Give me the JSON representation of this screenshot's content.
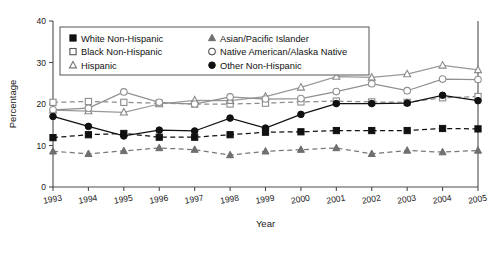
{
  "chart_data": {
    "type": "line",
    "title": "",
    "xlabel": "Year",
    "ylabel": "Percentage",
    "grid": false,
    "legend_position": "top-left-inside",
    "x": [
      1993,
      1994,
      1995,
      1996,
      1997,
      1998,
      1999,
      2000,
      2001,
      2002,
      2003,
      2004,
      2005
    ],
    "categories": [
      "1993",
      "1994",
      "1995",
      "1996",
      "1997",
      "1998",
      "1999",
      "2000",
      "2001",
      "2002",
      "2003",
      "2004",
      "2005"
    ],
    "xlim": [
      1993,
      2005
    ],
    "ylim": [
      0,
      40
    ],
    "yticks": [
      0,
      10,
      20,
      30,
      40
    ],
    "series": [
      {
        "name": "White Non-Hispanic",
        "marker": "filled-square",
        "linestyle": "dashed",
        "color": "#111111",
        "values": [
          11.9,
          12.6,
          12.9,
          12.0,
          12.0,
          12.6,
          13.2,
          13.3,
          13.6,
          13.6,
          13.6,
          14.1,
          14.0
        ]
      },
      {
        "name": "Black Non-Hispanic",
        "marker": "open-square",
        "linestyle": "dashed",
        "color": "#8c8c8c",
        "values": [
          20.4,
          20.6,
          20.4,
          20.2,
          20.0,
          20.0,
          20.2,
          20.5,
          20.7,
          20.5,
          20.4,
          21.5,
          21.8
        ]
      },
      {
        "name": "Hispanic",
        "marker": "open-triangle",
        "linestyle": "dashed",
        "color": "#777777",
        "values": [
          8.6,
          8.0,
          8.7,
          9.4,
          9.0,
          7.7,
          8.6,
          9.0,
          9.4,
          8.0,
          8.8,
          8.4,
          8.8
        ]
      },
      {
        "name": "Asian/Pacific Islander",
        "marker": "open-triangle",
        "linestyle": "solid",
        "color": "#999999",
        "values": [
          18.5,
          18.3,
          18.0,
          20.0,
          20.9,
          20.8,
          21.8,
          24.0,
          26.6,
          26.4,
          27.2,
          29.3,
          28.2
        ]
      },
      {
        "name": "Native American/Alaska Native",
        "marker": "open-circle",
        "linestyle": "solid",
        "color": "#8f8f8f",
        "values": [
          18.6,
          19.0,
          22.9,
          20.4,
          20.0,
          21.7,
          21.2,
          21.3,
          23.0,
          24.9,
          23.2,
          26.0,
          25.9
        ]
      },
      {
        "name": "Other Non-Hispanic",
        "marker": "filled-circle",
        "linestyle": "solid",
        "color": "#111111",
        "values": [
          17.0,
          14.6,
          12.3,
          13.7,
          13.5,
          16.6,
          14.2,
          17.5,
          20.1,
          20.1,
          20.2,
          22.1,
          20.8
        ]
      }
    ]
  },
  "legend": {
    "items": [
      "White Non-Hispanic",
      "Asian/Pacific Islander",
      "Black Non-Hispanic",
      "Native American/Alaska Native",
      "Hispanic",
      "Other Non-Hispanic"
    ]
  }
}
